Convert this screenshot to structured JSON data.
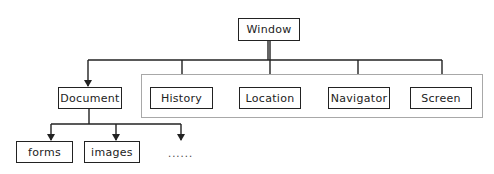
{
  "diagram": {
    "type": "tree",
    "root": {
      "label": "Window"
    },
    "children_of_window": [
      {
        "label": "Document"
      },
      {
        "label": "History"
      },
      {
        "label": "Location"
      },
      {
        "label": "Navigator"
      },
      {
        "label": "Screen"
      }
    ],
    "grouped_nodes": [
      "History",
      "Location",
      "Navigator",
      "Screen"
    ],
    "children_of_document": [
      {
        "label": "forms"
      },
      {
        "label": "images"
      },
      {
        "label": "......"
      }
    ]
  },
  "colors": {
    "line": "#222222",
    "group_border": "#a8a8a8",
    "background": "#ffffff"
  }
}
